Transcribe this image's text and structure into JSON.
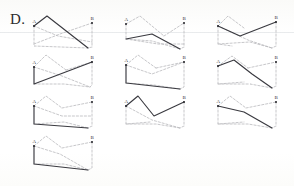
{
  "figure": {
    "label": "D.",
    "background_color": "#fdfdfc",
    "solid_color": "#3a3a40",
    "dashed_color": "#b9b9bd",
    "node_color": "#2e2e33",
    "label_color": "#35353a"
  },
  "nodes": {
    "start_label": "A",
    "end_label": "B"
  },
  "grid": {
    "columns": 3,
    "rows": 4,
    "panel_width": 68,
    "panel_height": 40,
    "col_x": [
      30,
      122,
      214
    ],
    "row_y": [
      14,
      54,
      94,
      134
    ]
  },
  "panels": [
    {
      "id": "panel-1",
      "row": 0,
      "col": 0,
      "a": [
        4,
        12
      ],
      "b": [
        62,
        9
      ],
      "solid_path": [
        [
          4,
          12
        ],
        [
          17,
          2
        ],
        [
          58,
          34
        ]
      ],
      "dashed_paths": [
        [
          [
            4,
            12
          ],
          [
            4,
            32
          ],
          [
            58,
            34
          ]
        ],
        [
          [
            4,
            30
          ],
          [
            30,
            20
          ],
          [
            62,
            9
          ]
        ],
        [
          [
            62,
            9
          ],
          [
            62,
            33
          ],
          [
            58,
            34
          ]
        ],
        [
          [
            4,
            12
          ],
          [
            28,
            22
          ],
          [
            62,
            28
          ]
        ]
      ]
    },
    {
      "id": "panel-2",
      "row": 0,
      "col": 1,
      "a": [
        4,
        10
      ],
      "b": [
        62,
        9
      ],
      "solid_path": [
        [
          4,
          25
        ],
        [
          30,
          20
        ],
        [
          58,
          35
        ]
      ],
      "dashed_paths": [
        [
          [
            4,
            10
          ],
          [
            18,
            2
          ],
          [
            42,
            22
          ]
        ],
        [
          [
            4,
            10
          ],
          [
            4,
            25
          ]
        ],
        [
          [
            42,
            22
          ],
          [
            62,
            9
          ]
        ],
        [
          [
            4,
            25
          ],
          [
            36,
            30
          ],
          [
            62,
            30
          ]
        ],
        [
          [
            62,
            9
          ],
          [
            62,
            33
          ],
          [
            58,
            35
          ]
        ],
        [
          [
            4,
            25
          ],
          [
            30,
            27
          ],
          [
            58,
            35
          ]
        ]
      ]
    },
    {
      "id": "panel-3",
      "row": 0,
      "col": 2,
      "a": [
        4,
        12
      ],
      "b": [
        62,
        8
      ],
      "solid_path": [
        [
          4,
          12
        ],
        [
          26,
          22
        ],
        [
          62,
          8
        ]
      ],
      "dashed_paths": [
        [
          [
            4,
            12
          ],
          [
            14,
            2
          ],
          [
            30,
            14
          ]
        ],
        [
          [
            4,
            12
          ],
          [
            4,
            30
          ],
          [
            18,
            32
          ]
        ],
        [
          [
            4,
            30
          ],
          [
            36,
            28
          ],
          [
            58,
            34
          ]
        ],
        [
          [
            62,
            8
          ],
          [
            62,
            32
          ],
          [
            58,
            34
          ]
        ],
        [
          [
            4,
            12
          ],
          [
            34,
            26
          ],
          [
            58,
            34
          ]
        ]
      ]
    },
    {
      "id": "panel-4",
      "row": 1,
      "col": 0,
      "a": [
        4,
        13
      ],
      "b": [
        62,
        8
      ],
      "solid_path": [
        [
          4,
          13
        ],
        [
          4,
          30
        ],
        [
          62,
          8
        ]
      ],
      "dashed_paths": [
        [
          [
            4,
            13
          ],
          [
            16,
            1
          ],
          [
            36,
            16
          ]
        ],
        [
          [
            36,
            16
          ],
          [
            62,
            8
          ]
        ],
        [
          [
            4,
            13
          ],
          [
            32,
            22
          ],
          [
            60,
            33
          ]
        ],
        [
          [
            4,
            30
          ],
          [
            34,
            30
          ],
          [
            60,
            33
          ]
        ],
        [
          [
            62,
            8
          ],
          [
            62,
            31
          ],
          [
            60,
            33
          ]
        ]
      ]
    },
    {
      "id": "panel-5",
      "row": 1,
      "col": 1,
      "a": [
        4,
        11
      ],
      "b": [
        62,
        8
      ],
      "solid_path": [
        [
          4,
          11
        ],
        [
          4,
          29
        ],
        [
          58,
          35
        ]
      ],
      "dashed_paths": [
        [
          [
            4,
            11
          ],
          [
            16,
            1
          ],
          [
            34,
            14
          ]
        ],
        [
          [
            34,
            14
          ],
          [
            62,
            8
          ]
        ],
        [
          [
            4,
            11
          ],
          [
            30,
            20
          ],
          [
            62,
            8
          ]
        ],
        [
          [
            4,
            29
          ],
          [
            32,
            31
          ],
          [
            58,
            35
          ]
        ],
        [
          [
            62,
            8
          ],
          [
            62,
            33
          ],
          [
            58,
            35
          ]
        ]
      ]
    },
    {
      "id": "panel-6",
      "row": 1,
      "col": 2,
      "a": [
        4,
        12
      ],
      "b": [
        62,
        8
      ],
      "solid_path": [
        [
          4,
          12
        ],
        [
          20,
          6
        ],
        [
          38,
          20
        ],
        [
          58,
          34
        ]
      ],
      "dashed_paths": [
        [
          [
            4,
            12
          ],
          [
            18,
            2
          ],
          [
            34,
            14
          ]
        ],
        [
          [
            34,
            14
          ],
          [
            62,
            8
          ]
        ],
        [
          [
            4,
            12
          ],
          [
            4,
            30
          ],
          [
            30,
            28
          ]
        ],
        [
          [
            4,
            30
          ],
          [
            36,
            30
          ],
          [
            58,
            34
          ]
        ],
        [
          [
            62,
            8
          ],
          [
            62,
            32
          ],
          [
            58,
            34
          ]
        ]
      ]
    },
    {
      "id": "panel-7",
      "row": 2,
      "col": 0,
      "a": [
        4,
        12
      ],
      "b": [
        62,
        8
      ],
      "solid_path": [
        [
          4,
          12
        ],
        [
          4,
          30
        ],
        [
          58,
          34
        ]
      ],
      "dashed_paths": [
        [
          [
            4,
            12
          ],
          [
            16,
            2
          ],
          [
            32,
            14
          ]
        ],
        [
          [
            32,
            14
          ],
          [
            62,
            8
          ]
        ],
        [
          [
            4,
            12
          ],
          [
            32,
            22
          ],
          [
            62,
            22
          ]
        ],
        [
          [
            4,
            30
          ],
          [
            34,
            28
          ],
          [
            58,
            34
          ]
        ],
        [
          [
            62,
            8
          ],
          [
            62,
            32
          ],
          [
            58,
            34
          ]
        ]
      ]
    },
    {
      "id": "panel-8",
      "row": 2,
      "col": 1,
      "a": [
        4,
        12
      ],
      "b": [
        62,
        8
      ],
      "solid_path": [
        [
          4,
          12
        ],
        [
          16,
          2
        ],
        [
          32,
          22
        ],
        [
          62,
          8
        ]
      ],
      "dashed_paths": [
        [
          [
            4,
            12
          ],
          [
            4,
            30
          ],
          [
            28,
            28
          ]
        ],
        [
          [
            4,
            30
          ],
          [
            34,
            30
          ],
          [
            58,
            34
          ]
        ],
        [
          [
            4,
            12
          ],
          [
            30,
            26
          ],
          [
            58,
            34
          ]
        ],
        [
          [
            62,
            8
          ],
          [
            62,
            32
          ],
          [
            58,
            34
          ]
        ]
      ]
    },
    {
      "id": "panel-9",
      "row": 2,
      "col": 2,
      "a": [
        4,
        12
      ],
      "b": [
        62,
        8
      ],
      "solid_path": [
        [
          4,
          12
        ],
        [
          30,
          18
        ],
        [
          58,
          34
        ]
      ],
      "dashed_paths": [
        [
          [
            4,
            12
          ],
          [
            16,
            2
          ],
          [
            32,
            14
          ]
        ],
        [
          [
            32,
            14
          ],
          [
            62,
            8
          ]
        ],
        [
          [
            4,
            12
          ],
          [
            4,
            30
          ],
          [
            30,
            28
          ]
        ],
        [
          [
            4,
            30
          ],
          [
            34,
            30
          ],
          [
            58,
            34
          ]
        ],
        [
          [
            62,
            8
          ],
          [
            62,
            32
          ],
          [
            58,
            34
          ]
        ]
      ]
    },
    {
      "id": "panel-10",
      "row": 3,
      "col": 0,
      "a": [
        4,
        12
      ],
      "b": [
        62,
        8
      ],
      "solid_path": [
        [
          4,
          12
        ],
        [
          4,
          30
        ],
        [
          58,
          36
        ]
      ],
      "dashed_paths": [
        [
          [
            4,
            12
          ],
          [
            16,
            2
          ],
          [
            32,
            14
          ]
        ],
        [
          [
            32,
            14
          ],
          [
            62,
            8
          ]
        ],
        [
          [
            4,
            12
          ],
          [
            30,
            20
          ],
          [
            58,
            36
          ]
        ],
        [
          [
            4,
            30
          ],
          [
            34,
            30
          ],
          [
            58,
            36
          ]
        ],
        [
          [
            62,
            8
          ],
          [
            62,
            34
          ],
          [
            58,
            36
          ]
        ]
      ]
    }
  ]
}
